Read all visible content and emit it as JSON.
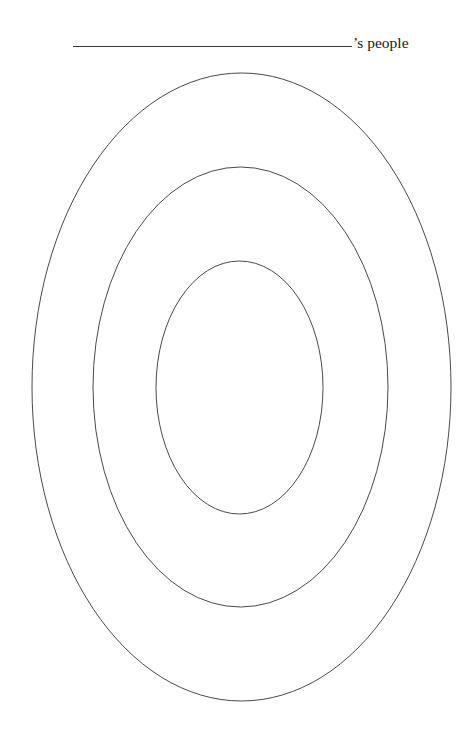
{
  "header": {
    "blank_line": "",
    "title_suffix": "’s people"
  },
  "diagram": {
    "type": "concentric-ellipses",
    "stroke_color": "#4a4a4a",
    "rings": [
      {
        "name": "outer",
        "cx": 241.5,
        "cy": 387,
        "rx": 209.5,
        "ry": 314
      },
      {
        "name": "middle",
        "cx": 240.5,
        "cy": 387,
        "rx": 147.5,
        "ry": 220
      },
      {
        "name": "inner",
        "cx": 239.5,
        "cy": 387.5,
        "rx": 83.5,
        "ry": 126.5
      }
    ]
  }
}
